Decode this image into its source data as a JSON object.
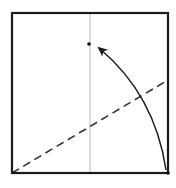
{
  "diagram": {
    "type": "origami-fold-step",
    "colors": {
      "background": "#ffffff",
      "paper_edge": "#1a1a1a",
      "crease": "#b8b8b8",
      "valley_fold": "#333333",
      "arrow": "#1a1a1a",
      "point": "#111111"
    },
    "paper_square": {
      "x1": 12,
      "y1": 13,
      "x2": 168,
      "y2": 173
    },
    "center_crease": {
      "x1": 90,
      "y1": 13,
      "x2": 90,
      "y2": 173
    },
    "valley_fold_line": {
      "x1": 12,
      "y1": 173,
      "x2": 168,
      "y2": 80,
      "dash": "8 5"
    },
    "source_point": {
      "x": 168,
      "y": 173
    },
    "target_point": {
      "x": 89,
      "y": 44
    },
    "fold_arrow": {
      "from": {
        "x": 166,
        "y": 170
      },
      "control": {
        "x": 155,
        "y": 95
      },
      "to": {
        "x": 99,
        "y": 48
      }
    }
  }
}
